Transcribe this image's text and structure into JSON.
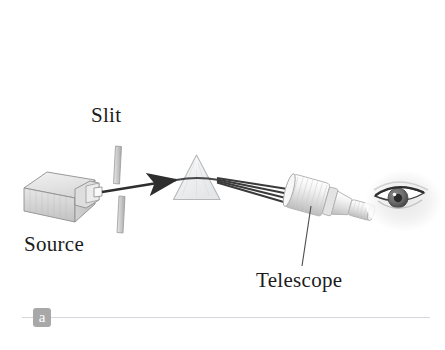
{
  "figure": {
    "background_color": "#ffffff",
    "width": 445,
    "height": 350
  },
  "labels": {
    "slit": "Slit",
    "source": "Source",
    "telescope": "Telescope"
  },
  "panel": {
    "badge_letter": "a",
    "badge_color": "#a8a8a8",
    "badge_text_color": "#ffffff",
    "rule_color": "#d4d7dc"
  },
  "components": [
    {
      "name": "source-box",
      "label": "Source",
      "description": "Rectangular 3D light-source housing with small output nozzle on its right face"
    },
    {
      "name": "slit",
      "label": "Slit",
      "description": "Two short vertical bars forming a narrow horizontal gap that the beam passes through"
    },
    {
      "name": "prism",
      "label": "",
      "description": "Equilateral triangular glass prism that disperses the incoming beam"
    },
    {
      "name": "telescope",
      "label": "Telescope",
      "description": "Cylindrical viewing telescope with wide objective end facing the prism"
    },
    {
      "name": "eye",
      "label": "",
      "description": "Human eye at the telescope eyepiece observing the spectrum"
    }
  ],
  "beams": {
    "incident_color": "#2e2e2e",
    "dispersed_color": "#3a3a3a",
    "dispersed_ray_count": 4,
    "arrow_direction": "left-to-right"
  },
  "colors": {
    "ink": "#1c1c1c",
    "glass_stroke": "#b9bcc0",
    "glass_fill": "#f3f4f5",
    "metal_light": "#f0f0f0",
    "metal_mid": "#d3d3d3",
    "metal_dark": "#9a9a9a"
  }
}
